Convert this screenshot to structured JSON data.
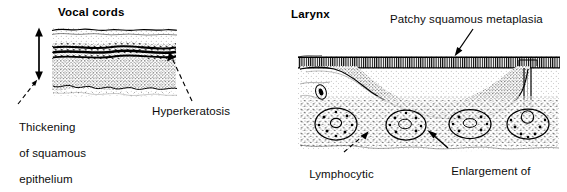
{
  "figure": {
    "background_color": "#ffffff",
    "ink_color": "#000000",
    "panels": [
      {
        "id": "vocal-cords",
        "title": "Vocal cords",
        "labels": [
          {
            "id": "thickening",
            "text": "Thickening\nof squamous\nepithelium",
            "leader": "dashed-arrow-up-right"
          },
          {
            "id": "hyperkeratosis",
            "text": "Hyperkeratosis",
            "leader": "dashed-arrow-up-left"
          }
        ],
        "measure_arrow": {
          "name": "thickness-double-arrow",
          "direction": "vertical-double-headed"
        }
      },
      {
        "id": "larynx",
        "title": "Larynx",
        "labels": [
          {
            "id": "patchy-metaplasia",
            "text": "Patchy squamous metaplasia",
            "leader": "solid-arrow-down-left"
          },
          {
            "id": "lymphocytic",
            "text": "Lymphocytic\nreaction",
            "leader": "dashed-arrow-up-right"
          },
          {
            "id": "enlargement",
            "text": "Enlargement of\nmucous glands",
            "leader": "solid-arrow-up-left"
          }
        ]
      }
    ]
  },
  "left_panel": {
    "title": "Vocal cords",
    "thickening_label_line1": "Thickening",
    "thickening_label_line2": "of squamous",
    "thickening_label_line3": "epithelium",
    "hyperkeratosis_label": "Hyperkeratosis"
  },
  "right_panel": {
    "title": "Larynx",
    "patchy_label": "Patchy squamous metaplasia",
    "lymphocytic_label_line1": "Lymphocytic",
    "lymphocytic_label_line2": "reaction",
    "enlargement_label_line1": "Enlargement of",
    "enlargement_label_line2": "mucous glands"
  },
  "icons": {
    "double_arrow": "double-headed-arrow-icon",
    "leader_arrow": "leader-arrow-icon"
  }
}
